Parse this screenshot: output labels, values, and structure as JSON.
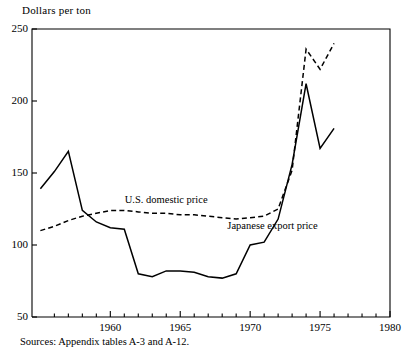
{
  "figure": {
    "axis_title": "Dollars per ton",
    "source_note": "Sources:  Appendix tables A-3 and A-12."
  },
  "chart_data": {
    "type": "line",
    "title": "",
    "subtitle": "",
    "xlabel": "",
    "ylabel": "Dollars per ton",
    "xlim": [
      1954.4,
      1980
    ],
    "ylim": [
      50,
      250
    ],
    "grid": false,
    "legend_position": "inline-annotation",
    "yticks": [
      50,
      100,
      150,
      200,
      250
    ],
    "ytick_labels": [
      "50",
      "100",
      "150",
      "200",
      "250"
    ],
    "xticks": [
      1960,
      1965,
      1970,
      1975,
      1980
    ],
    "xtick_labels": [
      "1960",
      "1965",
      "1970",
      "1975",
      "1980"
    ],
    "x_minor_ticks": [
      1956,
      1957,
      1958,
      1959,
      1961,
      1962,
      1963,
      1964,
      1966,
      1967,
      1968,
      1969,
      1971,
      1972,
      1973,
      1974,
      1976,
      1977,
      1978,
      1979
    ],
    "annotations": [
      {
        "text": "U.S. domestic price",
        "x": 1964.0,
        "y": 130
      },
      {
        "text": "Japanese export price",
        "x": 1971.6,
        "y": 112
      }
    ],
    "series": [
      {
        "name": "U.S. domestic price",
        "style": "dashed",
        "color": "#000000",
        "x": [
          1955,
          1956,
          1957,
          1958,
          1959,
          1960,
          1961,
          1962,
          1963,
          1964,
          1965,
          1966,
          1967,
          1968,
          1969,
          1970,
          1971,
          1972,
          1973,
          1974,
          1975,
          1976
        ],
        "y": [
          110,
          113,
          117,
          120,
          122,
          124,
          124,
          123,
          122,
          122,
          121,
          121,
          120,
          119,
          118,
          119,
          120,
          125,
          152,
          236,
          222,
          240
        ]
      },
      {
        "name": "Japanese export price",
        "style": "solid",
        "color": "#000000",
        "x": [
          1955,
          1956,
          1957,
          1958,
          1959,
          1960,
          1961,
          1962,
          1963,
          1964,
          1965,
          1966,
          1967,
          1968,
          1969,
          1970,
          1971,
          1972,
          1973,
          1974,
          1975,
          1976
        ],
        "y": [
          139,
          151,
          165,
          124,
          116,
          112,
          111,
          80,
          78,
          82,
          82,
          81,
          78,
          77,
          80,
          100,
          102,
          118,
          156,
          212,
          167,
          181
        ]
      }
    ]
  }
}
